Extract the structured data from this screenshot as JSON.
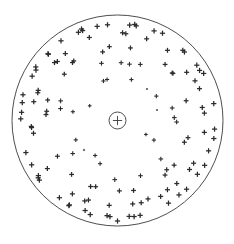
{
  "figure": {
    "background_color": "#ffffff",
    "line_color": "#3a3a3a",
    "marker_color": "#2b2b2b",
    "width": 234,
    "height": 244
  },
  "boundary": {
    "name": "outer-boundary-circle",
    "cx": 117.5,
    "cy": 120.5,
    "r": 105.5,
    "stroke_width": 0.9
  },
  "center_marker": {
    "name": "center-circled-plus",
    "cx": 117.5,
    "cy": 120.5,
    "ring_r": 8.5,
    "cross_half": 4.6,
    "stroke_width": 0.9
  },
  "chart_data": {
    "type": "scatter",
    "xlabel": "",
    "ylabel": "",
    "grid": false,
    "legend": null,
    "coordinate_system": "polar",
    "marker_symbol": "plus",
    "center": [
      117.5,
      120.5
    ],
    "boundary_radius": 105.5,
    "point_count": 152,
    "rings": [
      {
        "name": "ring-outer-dense",
        "radius": 97.0,
        "count": 56,
        "marker_size": 2.6,
        "angle_offset_deg": 3.0,
        "jitter": 1.4
      },
      {
        "name": "ring-outer-mid",
        "radius": 86.0,
        "count": 38,
        "marker_size": 2.5,
        "angle_offset_deg": 11.0,
        "jitter": 2.0
      },
      {
        "name": "ring-mid",
        "radius": 72.0,
        "count": 26,
        "marker_size": 2.4,
        "angle_offset_deg": 6.0,
        "jitter": 2.4
      },
      {
        "name": "ring-inner-mid",
        "radius": 58.0,
        "count": 16,
        "marker_size": 2.3,
        "angle_offset_deg": 19.0,
        "jitter": 2.6
      },
      {
        "name": "ring-inner",
        "radius": 44.0,
        "count": 10,
        "marker_size": 2.1,
        "angle_offset_deg": 27.0,
        "jitter": 2.8
      },
      {
        "name": "ring-core",
        "radius": 30.0,
        "count": 5,
        "marker_size": 1.8,
        "angle_offset_deg": 41.0,
        "jitter": 2.2
      }
    ],
    "outliers": [
      {
        "name": "outlier-below-boundary",
        "x": 117.5,
        "y": 221.0,
        "marker_size": 2.6
      },
      {
        "name": "outlier-faint-right-of-center",
        "x": 147.0,
        "y": 89.0,
        "marker_size": 1.0
      },
      {
        "name": "outlier-faint-mid-right",
        "x": 157.0,
        "y": 110.0,
        "marker_size": 1.0
      },
      {
        "name": "outlier-faint-left",
        "x": 84.0,
        "y": 150.0,
        "marker_size": 1.1
      }
    ]
  }
}
